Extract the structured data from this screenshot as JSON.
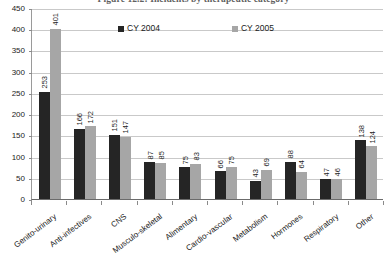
{
  "chart_data": {
    "type": "bar",
    "title": "Figure 12.2: Incidents by therapeutic category",
    "xlabel": "",
    "ylabel": "",
    "ylim": [
      0,
      450
    ],
    "ytick_step": 50,
    "yticks": [
      "450",
      "400",
      "350",
      "300",
      "250",
      "200",
      "150",
      "100",
      "50",
      "0"
    ],
    "grid": true,
    "legend_position": "top-inside",
    "categories": [
      "Genito-urinary",
      "Anti-infectives",
      "CNS",
      "Musculo-skeletal",
      "Alimentary",
      "Cardio-vascular",
      "Metabolism",
      "Hormones",
      "Respiratory",
      "Other"
    ],
    "series": [
      {
        "name": "CY 2004",
        "color": "#252525",
        "values": [
          253,
          166,
          151,
          87,
          75,
          66,
          43,
          88,
          47,
          138
        ]
      },
      {
        "name": "CY 2005",
        "color": "#a6a6a6",
        "values": [
          401,
          172,
          147,
          85,
          83,
          75,
          69,
          64,
          46,
          124
        ]
      }
    ]
  }
}
